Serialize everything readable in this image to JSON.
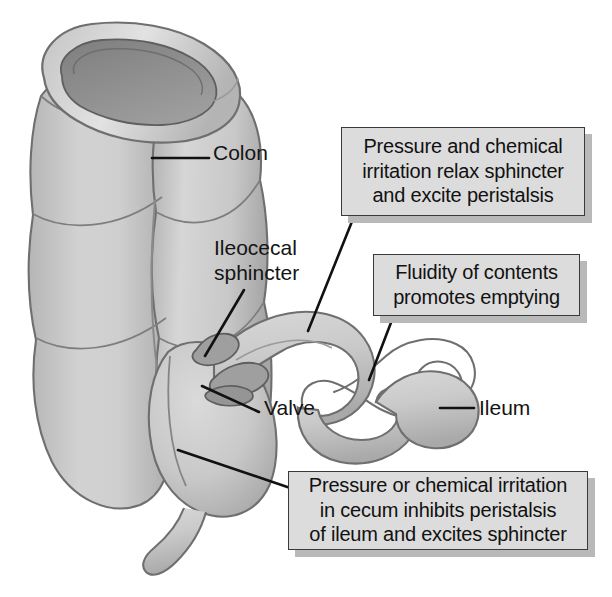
{
  "figure": {
    "background_color": "#ffffff",
    "line_color": "#111111",
    "tissue_fill": "#c9c9c9",
    "tissue_outline": "#6b6b6b",
    "lumen_fill": "#8d8d8d",
    "box_fill": "#dcdcdc",
    "box_border": "#3a3a3a",
    "box_shadow": "#b9b9b9"
  },
  "labels": {
    "colon": "Colon",
    "ileocecal_line1": "Ileocecal",
    "ileocecal_line2": "sphincter",
    "valve": "Valve",
    "ileum": "Ileum"
  },
  "callouts": {
    "sphincter_relax": {
      "line1": "Pressure and chemical",
      "line2": "irritation relax sphincter",
      "line3": "and excite peristalsis"
    },
    "fluidity": {
      "line1": "Fluidity of contents",
      "line2": "promotes emptying"
    },
    "cecum_inhibits": {
      "line1": "Pressure or chemical irritation",
      "line2": "in cecum inhibits peristalsis",
      "line3": "of ileum and excites sphincter"
    }
  },
  "anatomy_parts": [
    "colon",
    "cecum",
    "appendix",
    "ileum",
    "ileocecal sphincter",
    "ileocecal valve"
  ]
}
